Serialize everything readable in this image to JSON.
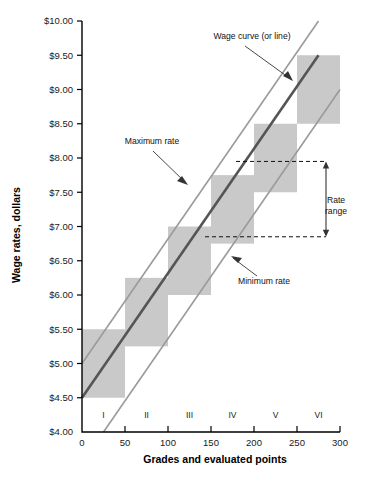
{
  "chart_data": {
    "type": "line",
    "title": "",
    "xlabel": "Grades and evaluated points",
    "ylabel": "Wage rates, dollars",
    "xlim": [
      0,
      300
    ],
    "ylim": [
      4.0,
      10.0
    ],
    "grid": false,
    "legend_position": "none",
    "x_ticks": [
      "0",
      "50",
      "100",
      "150",
      "200",
      "250",
      "300"
    ],
    "x_tick_values": [
      0,
      50,
      100,
      150,
      200,
      250,
      300
    ],
    "y_ticks": [
      "$4.00",
      "$4.50",
      "$5.00",
      "$5.50",
      "$6.00",
      "$6.50",
      "$7.00",
      "$7.50",
      "$8.00",
      "$8.50",
      "$9.00",
      "$9.50",
      "$10.00"
    ],
    "y_tick_values": [
      4.0,
      4.5,
      5.0,
      5.5,
      6.0,
      6.5,
      7.0,
      7.5,
      8.0,
      8.5,
      9.0,
      9.5,
      10.0
    ],
    "grade_labels": [
      "I",
      "II",
      "III",
      "IV",
      "V",
      "VI"
    ],
    "grade_label_x": [
      25,
      75,
      125,
      175,
      225,
      275
    ],
    "series": [
      {
        "name": "Wage curve (or line)",
        "type": "line",
        "color": "#555555",
        "x": [
          0,
          275
        ],
        "values": [
          4.5,
          9.5
        ]
      },
      {
        "name": "Maximum rate",
        "type": "line",
        "color": "#9a9a9a",
        "x": [
          0,
          275
        ],
        "values": [
          5.0,
          10.0
        ]
      },
      {
        "name": "Minimum rate",
        "type": "line",
        "color": "#9a9a9a",
        "x": [
          25,
          300
        ],
        "values": [
          4.0,
          9.0
        ]
      }
    ],
    "grade_bands": [
      {
        "grade": "I",
        "x_start": 0,
        "x_end": 50,
        "rate_min": 4.5,
        "rate_max": 5.5
      },
      {
        "grade": "II",
        "x_start": 50,
        "x_end": 100,
        "rate_min": 5.25,
        "rate_max": 6.25
      },
      {
        "grade": "III",
        "x_start": 100,
        "x_end": 150,
        "rate_min": 6.0,
        "rate_max": 7.0
      },
      {
        "grade": "IV",
        "x_start": 150,
        "x_end": 200,
        "rate_min": 6.75,
        "rate_max": 7.75
      },
      {
        "grade": "V",
        "x_start": 200,
        "x_end": 250,
        "rate_min": 7.5,
        "rate_max": 8.5
      },
      {
        "grade": "VI",
        "x_start": 250,
        "x_end": 300,
        "rate_min": 8.5,
        "rate_max": 9.5
      }
    ],
    "annotations": [
      {
        "id": "wage-curve",
        "text": "Wage curve (or line)"
      },
      {
        "id": "maximum-rate",
        "text": "Maximum rate"
      },
      {
        "id": "minimum-rate",
        "text": "Minimum rate"
      },
      {
        "id": "rate-range",
        "text_line1": "Rate",
        "text_line2": "range"
      }
    ],
    "rate_range_marker": {
      "upper_value": 7.95,
      "lower_value": 6.85,
      "label": "Rate range"
    },
    "colors": {
      "band_fill": "#c9c9c9",
      "wage_line": "#555555",
      "boundary_line": "#9a9a9a",
      "axis": "#000000",
      "text": "#111111"
    }
  }
}
